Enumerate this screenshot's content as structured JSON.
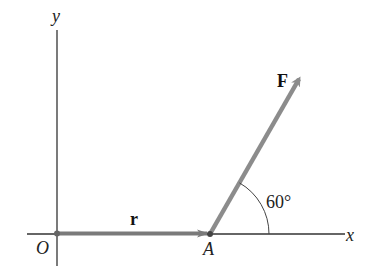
{
  "diagram": {
    "axes": {
      "x_label": "x",
      "y_label": "y",
      "origin_label": "O"
    },
    "points": {
      "origin": "O",
      "application_point": "A"
    },
    "vectors": {
      "position": {
        "label": "r",
        "from": "O",
        "to": "A"
      },
      "force": {
        "label": "F",
        "from": "A",
        "angle_deg": 60
      }
    },
    "angle": {
      "label": "60°",
      "value_deg": 60
    },
    "colors": {
      "vector": "#8c8c8c",
      "axis": "#333333",
      "background": "#ffffff"
    }
  }
}
